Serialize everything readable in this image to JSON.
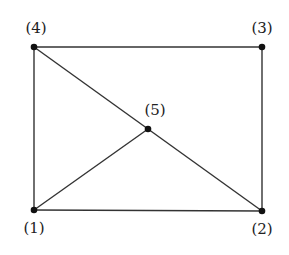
{
  "diagram": {
    "type": "graph",
    "nodes": [
      {
        "id": "1",
        "label": "(1)",
        "x": 34,
        "y": 210,
        "label_x": 34,
        "label_y": 228
      },
      {
        "id": "2",
        "label": "(2)",
        "x": 262,
        "y": 211,
        "label_x": 262,
        "label_y": 229
      },
      {
        "id": "3",
        "label": "(3)",
        "x": 262,
        "y": 47,
        "label_x": 262,
        "label_y": 28
      },
      {
        "id": "4",
        "label": "(4)",
        "x": 34,
        "y": 47,
        "label_x": 36,
        "label_y": 28
      },
      {
        "id": "5",
        "label": "(5)",
        "x": 148,
        "y": 129,
        "label_x": 155,
        "label_y": 110
      }
    ],
    "edges": [
      [
        "4",
        "3"
      ],
      [
        "3",
        "2"
      ],
      [
        "2",
        "1"
      ],
      [
        "1",
        "4"
      ],
      [
        "4",
        "5"
      ],
      [
        "5",
        "2"
      ],
      [
        "1",
        "5"
      ]
    ],
    "colors": {
      "line": "#333333",
      "node": "#111111"
    }
  }
}
